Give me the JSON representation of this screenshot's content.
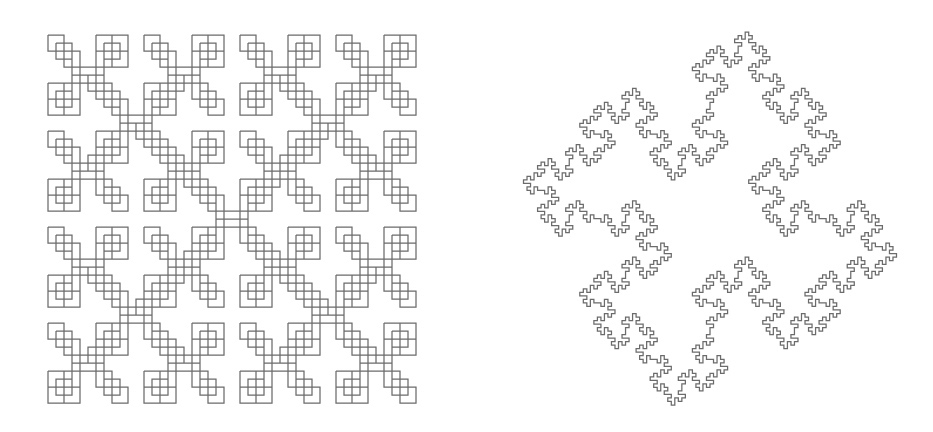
{
  "page": {
    "width": 933,
    "height": 432,
    "background_color": "#ffffff",
    "figure_count": 2
  },
  "style": {
    "stroke_color": "#6b6b6b",
    "stroke_width": 1.25,
    "fill": "none"
  },
  "figures": [
    {
      "id": "left-fractal",
      "name": "square-cross-fractal",
      "label": "Recursive square cross (X) fractal",
      "type": "recursive-square-cross",
      "panel": {
        "x": 0,
        "y": 0,
        "width": 466,
        "height": 432
      },
      "geometry": {
        "center_x": 232,
        "center_y": 219,
        "depth": 3,
        "base_square_size": 16,
        "branch_ratio": 0.5,
        "first_branch_offset": 96,
        "diagonal_directions": [
          {
            "dx": -1,
            "dy": -1
          },
          {
            "dx": 1,
            "dy": -1
          },
          {
            "dx": -1,
            "dy": 1
          },
          {
            "dx": 1,
            "dy": 1
          }
        ],
        "connector_steps": 3,
        "extent": {
          "left": 36,
          "top": 36,
          "right": 428,
          "bottom": 403
        }
      }
    },
    {
      "id": "right-fractal",
      "name": "quadratic-koch-island",
      "label": "Quadratic Koch island (Minkowski sausage boundary)",
      "type": "quadratic-koch-island",
      "panel": {
        "x": 466,
        "y": 0,
        "width": 467,
        "height": 432
      },
      "geometry": {
        "center_x": 710,
        "center_y": 219,
        "iterations": 3,
        "initiator": "square",
        "initiator_side": 160,
        "segment_divisions": 8,
        "unit_step": 12.5,
        "rotation_deg": 0,
        "extent": {
          "left": 515,
          "top": 32,
          "right": 905,
          "bottom": 405
        }
      }
    }
  ]
}
